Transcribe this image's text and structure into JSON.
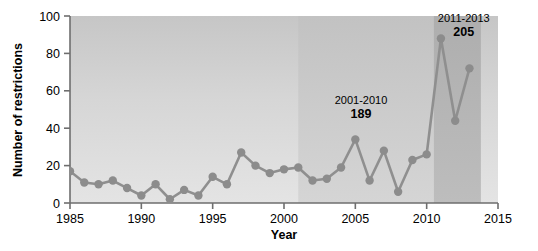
{
  "chart_data": {
    "type": "line",
    "title": "",
    "subtitle": "",
    "xlabel": "Year",
    "ylabel": "Number of restrictions",
    "xlim": [
      1985,
      2015
    ],
    "ylim": [
      0,
      100
    ],
    "xticks": [
      1985,
      1990,
      1995,
      2000,
      2005,
      2010,
      2015
    ],
    "xtick_labels": [
      "1985",
      "1990",
      "1995",
      "2000",
      "2005",
      "2010",
      "2015"
    ],
    "yticks": [
      0,
      20,
      40,
      60,
      80,
      100
    ],
    "ytick_labels": [
      "0",
      "20",
      "40",
      "60",
      "80",
      "100"
    ],
    "grid": false,
    "legend": "none",
    "x": [
      1985,
      1986,
      1987,
      1988,
      1989,
      1990,
      1991,
      1992,
      1993,
      1994,
      1995,
      1996,
      1997,
      1998,
      1999,
      2000,
      2001,
      2002,
      2003,
      2004,
      2005,
      2006,
      2007,
      2008,
      2009,
      2010,
      2011,
      2012,
      2013
    ],
    "values": [
      17,
      11,
      10,
      12,
      8,
      4,
      10,
      2,
      7,
      4,
      14,
      10,
      27,
      20,
      16,
      18,
      19,
      12,
      13,
      19,
      34,
      12,
      28,
      6,
      23,
      26,
      88,
      44,
      72
    ],
    "series": [
      {
        "name": "Number of restrictions",
        "values": [
          17,
          11,
          10,
          12,
          8,
          4,
          10,
          2,
          7,
          4,
          14,
          10,
          27,
          20,
          16,
          18,
          19,
          12,
          13,
          19,
          34,
          12,
          28,
          6,
          23,
          26,
          88,
          44,
          72
        ]
      }
    ],
    "annotations": [
      {
        "range_label": "2001-2010",
        "value_label": "189",
        "band_start": 2001,
        "band_end": 2010.5,
        "label_x": 2005.4,
        "label_y": 53
      },
      {
        "range_label": "2011-2013",
        "value_label": "205",
        "band_start": 2010.5,
        "band_end": 2013.8,
        "label_x": 2012.6,
        "label_y": 97
      }
    ],
    "colors": {
      "line": "#8f8f8f",
      "marker": "#8c8c8c",
      "plot_background_top": "#c9c9c9",
      "plot_background_bottom": "#e2e2e2",
      "band_light": "#cfcfcf",
      "band_dark": "#b4b4b4",
      "axis": "#6e6e6e",
      "text": "#000000"
    }
  }
}
